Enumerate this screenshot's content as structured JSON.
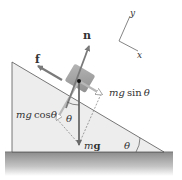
{
  "diagram": {
    "axes": {
      "y_label": "y",
      "x_label": "x"
    },
    "forces": {
      "normal": {
        "label": "n"
      },
      "friction": {
        "label": "f"
      },
      "gravity": {
        "label": "mg"
      },
      "parallel_component": {
        "label": "mg sin θ",
        "m": "m",
        "g": "g",
        "func": "sin",
        "theta": "θ"
      },
      "perpendicular_component": {
        "label": "mg cos θ",
        "m": "m",
        "g": "g",
        "func": "cos",
        "theta": "θ"
      }
    },
    "angles": {
      "incline_angle": "θ",
      "gravity_angle": "θ"
    },
    "colors": {
      "incline_fill": "#ededed",
      "ground": "#9a9a9a",
      "block": "#8f8f8f",
      "arrow": "#7a7a7a",
      "gravity_arrow": "#6a6a6a",
      "component_arrow": "#b0b0b0",
      "text": "#333333"
    }
  }
}
